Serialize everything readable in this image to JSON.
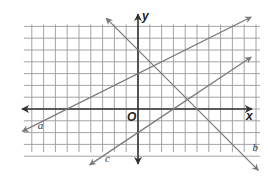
{
  "chart_data": {
    "type": "line",
    "title": "",
    "xlabel": "x",
    "ylabel": "y",
    "origin_label": "O",
    "grid": true,
    "tick_labels": false,
    "xlim": [
      -9,
      10
    ],
    "ylim": [
      -4,
      7
    ],
    "series": [
      {
        "name": "a",
        "equation": "y = 0.5x + 3",
        "slope": 0.5,
        "intercept": 3,
        "x_range": [
          -9.8,
          9.6
        ],
        "label_at": [
          -8.5,
          -1.7
        ]
      },
      {
        "name": "b",
        "equation": "y = -x + 5",
        "slope": -1,
        "intercept": 5,
        "x_range": [
          -2.7,
          10.2
        ],
        "label_at": [
          9.7,
          -3.6
        ]
      },
      {
        "name": "c",
        "equation": "y = (2/3)x - 2",
        "slope": 0.6667,
        "intercept": -2,
        "x_range": [
          -4.1,
          9.6
        ],
        "label_at": [
          -2.8,
          -4.5
        ]
      }
    ],
    "intersections": [
      {
        "lines": [
          "a",
          "b"
        ],
        "point": [
          1.33,
          3.67
        ]
      },
      {
        "lines": [
          "b",
          "c"
        ],
        "point": [
          4.2,
          0.8
        ]
      }
    ]
  },
  "colors": {
    "grid": "#9a9a9a",
    "axis": "#333333",
    "lines": "#7a7a7a"
  }
}
